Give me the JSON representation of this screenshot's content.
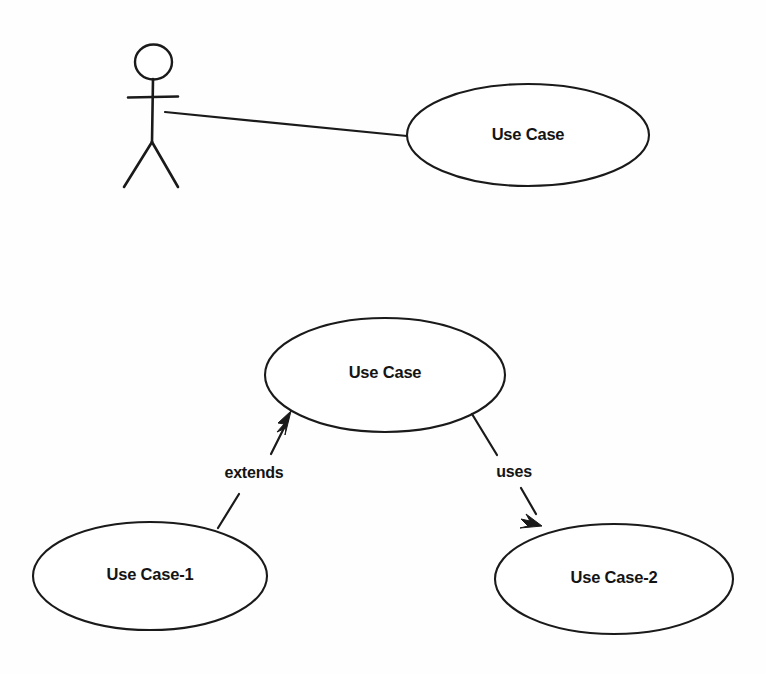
{
  "diagram": {
    "kind": "uml-use-case-diagram",
    "width": 766,
    "height": 674,
    "background_color": "#fefefe",
    "stroke_color": "#1a1a1a",
    "text_color": "#141414"
  },
  "actor": {
    "name": "actor-stick-figure",
    "label": "",
    "head": {
      "cx": 153.5,
      "cy": 62,
      "rx": 18.5,
      "ry": 17.5
    },
    "body": {
      "x1": 153,
      "y1": 79,
      "x2": 152,
      "y2": 142
    },
    "arms": {
      "x1": 128,
      "y1": 97,
      "x2": 178,
      "y2": 96
    },
    "leg_left": {
      "x1": 152,
      "y1": 142,
      "x2": 124,
      "y2": 187
    },
    "leg_right": {
      "x1": 152,
      "y1": 142,
      "x2": 178,
      "y2": 187
    }
  },
  "use_cases": [
    {
      "id": "use-case-top",
      "label": "Use Case",
      "cx": 528,
      "cy": 135,
      "rx": 121,
      "ry": 51
    },
    {
      "id": "use-case-middle",
      "label": "Use Case",
      "cx": 385,
      "cy": 375,
      "rx": 120,
      "ry": 57
    },
    {
      "id": "use-case-1",
      "label": "Use Case-1",
      "cx": 150,
      "cy": 576,
      "rx": 117,
      "ry": 54
    },
    {
      "id": "use-case-2",
      "label": "Use Case-2",
      "cx": 614,
      "cy": 579,
      "rx": 119,
      "ry": 55
    }
  ],
  "relationships": [
    {
      "id": "association-actor-usecase",
      "type": "association",
      "label": "",
      "from": "actor-stick-figure",
      "to": "use-case-top",
      "x1": 165,
      "y1": 112,
      "x2": 407,
      "y2": 136,
      "arrow": "none"
    },
    {
      "id": "extends-relationship",
      "type": "extends",
      "label": "extends",
      "from": "use-case-1",
      "to": "use-case-middle",
      "label_x": 254,
      "label_y": 474,
      "seg1": {
        "x1": 218,
        "y1": 528,
        "x2": 238,
        "y2": 495
      },
      "seg2": {
        "x1": 272,
        "y1": 452,
        "x2": 291,
        "y2": 414
      },
      "arrow": "filled-triangle-up-right"
    },
    {
      "id": "uses-relationship",
      "type": "uses",
      "label": "uses",
      "from": "use-case-middle",
      "to": "use-case-2",
      "label_x": 514,
      "label_y": 473,
      "seg1": {
        "x1": 472,
        "y1": 414,
        "x2": 499,
        "y2": 456
      },
      "seg2": {
        "x1": 524,
        "y1": 492,
        "x2": 541,
        "y2": 523
      },
      "arrow": "filled-triangle-down-right"
    }
  ]
}
